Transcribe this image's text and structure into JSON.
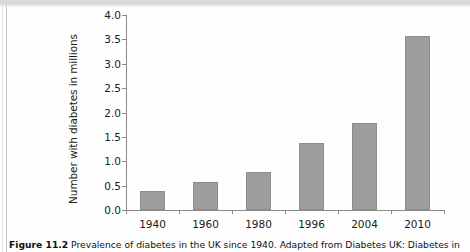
{
  "figure": {
    "caption_label": "Figure 11.2",
    "caption_text": "Prevalence of diabetes in the UK since 1940. Adapted from Diabetes UK: Diabetes in"
  },
  "chart_data": {
    "type": "bar",
    "title": "",
    "xlabel": "",
    "ylabel": "Number with diabetes in millions",
    "categories": [
      "1940",
      "1960",
      "1980",
      "1996",
      "2004",
      "2010"
    ],
    "values": [
      0.4,
      0.58,
      0.78,
      1.38,
      1.78,
      3.57
    ],
    "ylim": [
      0.0,
      4.0
    ],
    "ytick_labels": [
      "0.0",
      "0.5",
      "1.0",
      "1.5",
      "2.0",
      "2.5",
      "3.0",
      "3.5",
      "4.0"
    ],
    "ytick_values": [
      0.0,
      0.5,
      1.0,
      1.5,
      2.0,
      2.5,
      3.0,
      3.5,
      4.0
    ],
    "grid": false,
    "legend": "none",
    "bar_color": "#9d9d9d",
    "bar_edge_color": "#8e8e8e",
    "axis_color": "#8a8a8a"
  }
}
